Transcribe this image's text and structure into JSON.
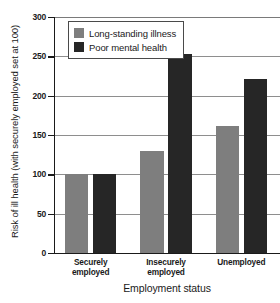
{
  "chart_data": {
    "type": "bar",
    "title": "",
    "categories": [
      "Securely\nemployed",
      "Insecurely\nemployed",
      "Unemployed"
    ],
    "category_lines": [
      [
        "Securely",
        "employed"
      ],
      [
        "Insecurely",
        "employed"
      ],
      [
        "Unemployed"
      ]
    ],
    "series": [
      {
        "name": "Long-standing illness",
        "color": "#7e7e7e",
        "values": [
          100,
          130,
          161
        ]
      },
      {
        "name": "Poor mental health",
        "color": "#262626",
        "values": [
          100,
          253,
          221
        ]
      }
    ],
    "xlabel": "Employment status",
    "ylabel": "Risk of ill health (with securely employed set at 100)",
    "ylim": [
      0,
      300
    ],
    "yticks": [
      0,
      50,
      100,
      150,
      200,
      250,
      300
    ],
    "ytick_labels": [
      "0",
      "50",
      "100",
      "150",
      "200",
      "250",
      "300"
    ],
    "grid": true,
    "grid_axis": "y",
    "legend_position": "top-left"
  }
}
